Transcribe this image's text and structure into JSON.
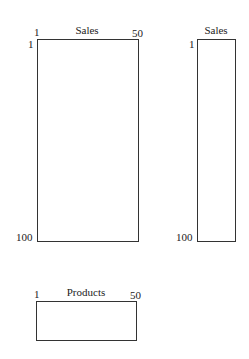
{
  "diagram": {
    "matrices": [
      {
        "id": "sales-by-products",
        "title": "Sales",
        "col_start": "1",
        "col_end": "50",
        "row_start": "1",
        "row_end": "100"
      },
      {
        "id": "sales-vector",
        "title": "Sales",
        "row_start": "1",
        "row_end": "100"
      },
      {
        "id": "products-vector",
        "title": "Products",
        "col_start": "1",
        "col_end": "50"
      }
    ]
  }
}
